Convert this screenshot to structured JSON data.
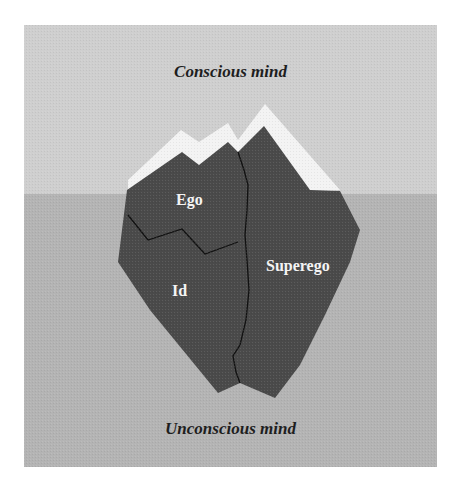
{
  "diagram": {
    "zones": {
      "above": {
        "label": "Conscious mind",
        "color": "#cfcfcf"
      },
      "below": {
        "label": "Unconscious mind",
        "color": "#b4b4b4"
      }
    },
    "iceberg": {
      "color": "#4a4a4a",
      "snow_color": "#f3f3f3",
      "parts": [
        {
          "id": "ego",
          "label": "Ego"
        },
        {
          "id": "superego",
          "label": "Superego"
        },
        {
          "id": "id",
          "label": "Id"
        }
      ]
    }
  }
}
